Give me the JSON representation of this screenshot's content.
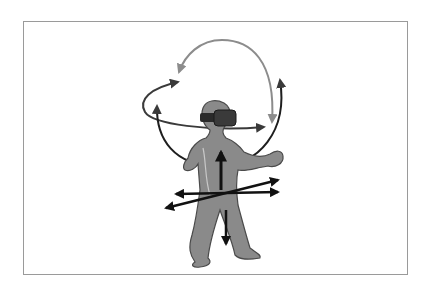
{
  "figure": {
    "colors": {
      "background": "#ffffff",
      "frame_border": "#9a9a9a",
      "body_fill": "#8a8a8a",
      "body_outline": "#4a4a4a",
      "headset": "#2e2e2e",
      "rotation_arc_gray": "#8c8c8c",
      "rotation_arc_dark": "#3a3a3a",
      "translation_arrow": "#111111"
    },
    "elements": {
      "person": "person-figure",
      "headset": "vr-headset",
      "rotation_arcs": [
        "pitch-arc",
        "yaw-arc",
        "roll-arc"
      ],
      "translation_arrows": [
        "up-down-arrow",
        "left-right-arrow",
        "forward-back-arrow"
      ]
    }
  }
}
